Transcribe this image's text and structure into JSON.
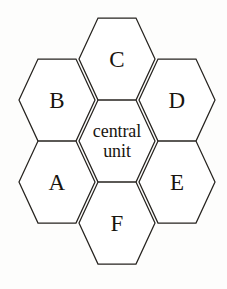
{
  "diagram": {
    "background_color": "#fdfdfc",
    "stroke_color": "#26231f",
    "fill_color": "#ffffff",
    "orientation": "flat-top-hexagon-cluster",
    "hex_width": 76,
    "hex_height": 82,
    "cells": [
      {
        "id": "cell-c",
        "label": "C",
        "cx": 117,
        "cy": 59,
        "role": "outer",
        "label_style": "letter"
      },
      {
        "id": "cell-b",
        "label": "B",
        "cx": 57,
        "cy": 100,
        "role": "outer",
        "label_style": "letter"
      },
      {
        "id": "cell-d",
        "label": "D",
        "cx": 177,
        "cy": 100,
        "role": "outer",
        "label_style": "letter"
      },
      {
        "id": "cell-central",
        "label": "central\nunit",
        "cx": 117,
        "cy": 141,
        "role": "center",
        "label_style": "central"
      },
      {
        "id": "cell-a",
        "label": "A",
        "cx": 57,
        "cy": 182,
        "role": "outer",
        "label_style": "letter"
      },
      {
        "id": "cell-e",
        "label": "E",
        "cx": 177,
        "cy": 182,
        "role": "outer",
        "label_style": "letter"
      },
      {
        "id": "cell-f",
        "label": "F",
        "cx": 117,
        "cy": 223,
        "role": "outer",
        "label_style": "letter"
      }
    ]
  }
}
